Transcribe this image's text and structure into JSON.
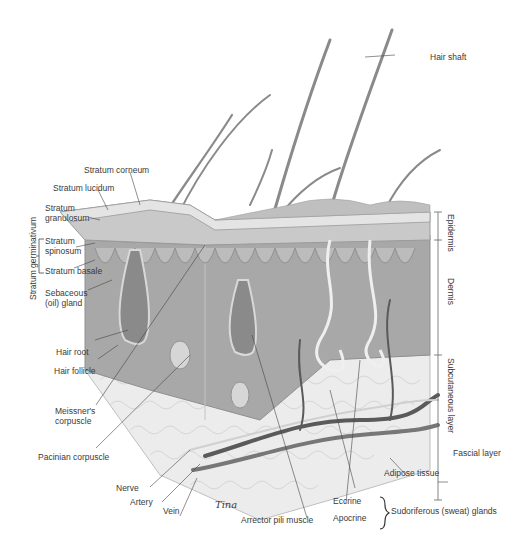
{
  "diagram": {
    "type": "anatomical-illustration",
    "colors": {
      "background": "#ffffff",
      "epidermis": "#bdbdbd",
      "dermis": "#9e9e9e",
      "subcutaneous": "#e6e6e6",
      "hair": "#7a7a7a",
      "vessel": "#555555",
      "label_text": "#3a3a3a"
    },
    "labels": {
      "hair_shaft": "Hair shaft",
      "stratum_corneum": "Stratum corneum",
      "stratum_lucidum": "Stratum lucidum",
      "stratum_granulosum_1": "Stratum",
      "stratum_granulosum_2": "granulosum",
      "stratum_spinosum_1": "Stratum",
      "stratum_spinosum_2": "spinosum",
      "stratum_basale": "Stratum basale",
      "stratum_germinativum": "Stratum germinativum",
      "sebaceous_1": "Sebaceous",
      "sebaceous_2": "(oil) gland",
      "hair_root": "Hair root",
      "hair_follicle": "Hair follicle",
      "meissner_1": "Meissner's",
      "meissner_2": "corpuscle",
      "pacinian": "Pacinian corpuscle",
      "nerve": "Nerve",
      "artery": "Artery",
      "vein": "Vein",
      "arrector": "Arrector pili muscle",
      "eccrine": "Eccrine",
      "apocrine": "Apocrine",
      "sudoriferous": "Sudoriferous (sweat) glands",
      "adipose": "Adipose tissue",
      "fascial": "Fascial layer",
      "epidermis": "Epidermis",
      "dermis": "Dermis",
      "subcutaneous": "Subcutaneous layer",
      "signature": "Tina"
    }
  }
}
